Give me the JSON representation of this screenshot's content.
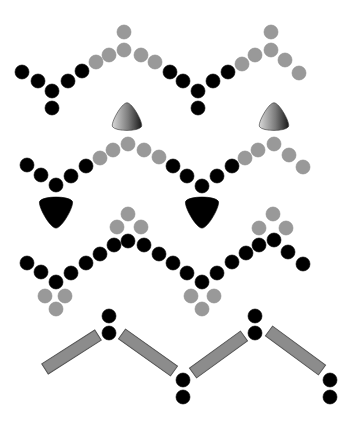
{
  "colors": {
    "black": "#000000",
    "grey": "#999999",
    "grey_stroke": "#8a8a8a",
    "bar_fill": "#8c8c8c",
    "bar_stroke": "#555555",
    "background": "#ffffff"
  },
  "dot_radius": 7,
  "rows": [
    {
      "name": "row-1-chain",
      "dots": [
        {
          "x": 22,
          "y": 72,
          "c": "black"
        },
        {
          "x": 38,
          "y": 81,
          "c": "black"
        },
        {
          "x": 52,
          "y": 91,
          "c": "black"
        },
        {
          "x": 52,
          "y": 108,
          "c": "black"
        },
        {
          "x": 68,
          "y": 81,
          "c": "black"
        },
        {
          "x": 82,
          "y": 71,
          "c": "black"
        },
        {
          "x": 96,
          "y": 62,
          "c": "grey"
        },
        {
          "x": 109,
          "y": 55,
          "c": "grey"
        },
        {
          "x": 124,
          "y": 50,
          "c": "grey"
        },
        {
          "x": 124,
          "y": 32,
          "c": "grey"
        },
        {
          "x": 141,
          "y": 55,
          "c": "grey"
        },
        {
          "x": 155,
          "y": 62,
          "c": "grey"
        },
        {
          "x": 170,
          "y": 72,
          "c": "black"
        },
        {
          "x": 183,
          "y": 81,
          "c": "black"
        },
        {
          "x": 198,
          "y": 91,
          "c": "black"
        },
        {
          "x": 198,
          "y": 108,
          "c": "black"
        },
        {
          "x": 213,
          "y": 81,
          "c": "black"
        },
        {
          "x": 228,
          "y": 72,
          "c": "black"
        },
        {
          "x": 242,
          "y": 64,
          "c": "grey"
        },
        {
          "x": 255,
          "y": 55,
          "c": "grey"
        },
        {
          "x": 271,
          "y": 50,
          "c": "grey"
        },
        {
          "x": 271,
          "y": 32,
          "c": "grey"
        },
        {
          "x": 285,
          "y": 60,
          "c": "grey"
        },
        {
          "x": 299,
          "y": 73,
          "c": "grey"
        }
      ]
    },
    {
      "name": "row-2-chain",
      "dots": [
        {
          "x": 27,
          "y": 165,
          "c": "black"
        },
        {
          "x": 41,
          "y": 175,
          "c": "black"
        },
        {
          "x": 56,
          "y": 185,
          "c": "black"
        },
        {
          "x": 71,
          "y": 176,
          "c": "black"
        },
        {
          "x": 86,
          "y": 166,
          "c": "black"
        },
        {
          "x": 100,
          "y": 158,
          "c": "grey"
        },
        {
          "x": 113,
          "y": 150,
          "c": "grey"
        },
        {
          "x": 128,
          "y": 144,
          "c": "grey"
        },
        {
          "x": 144,
          "y": 150,
          "c": "grey"
        },
        {
          "x": 159,
          "y": 157,
          "c": "grey"
        },
        {
          "x": 173,
          "y": 166,
          "c": "black"
        },
        {
          "x": 187,
          "y": 176,
          "c": "black"
        },
        {
          "x": 202,
          "y": 186,
          "c": "black"
        },
        {
          "x": 217,
          "y": 176,
          "c": "black"
        },
        {
          "x": 232,
          "y": 166,
          "c": "black"
        },
        {
          "x": 245,
          "y": 158,
          "c": "grey"
        },
        {
          "x": 258,
          "y": 150,
          "c": "grey"
        },
        {
          "x": 274,
          "y": 144,
          "c": "grey"
        },
        {
          "x": 289,
          "y": 155,
          "c": "grey"
        },
        {
          "x": 303,
          "y": 167,
          "c": "grey"
        }
      ],
      "blobs": [
        {
          "x": 127,
          "y": 118,
          "size": 16,
          "kind": "grey-gradient",
          "dir": "up"
        },
        {
          "x": 274,
          "y": 118,
          "size": 16,
          "kind": "grey-gradient",
          "dir": "up"
        },
        {
          "x": 56,
          "y": 211,
          "size": 18,
          "kind": "black",
          "dir": "down"
        },
        {
          "x": 202,
          "y": 211,
          "size": 18,
          "kind": "black",
          "dir": "down"
        }
      ]
    },
    {
      "name": "row-3-chain",
      "dots": [
        {
          "x": 128,
          "y": 214,
          "c": "grey"
        },
        {
          "x": 117,
          "y": 227,
          "c": "grey"
        },
        {
          "x": 141,
          "y": 227,
          "c": "grey"
        },
        {
          "x": 273,
          "y": 214,
          "c": "grey"
        },
        {
          "x": 259,
          "y": 228,
          "c": "grey"
        },
        {
          "x": 286,
          "y": 228,
          "c": "grey"
        },
        {
          "x": 27,
          "y": 263,
          "c": "black"
        },
        {
          "x": 41,
          "y": 272,
          "c": "black"
        },
        {
          "x": 56,
          "y": 282,
          "c": "black"
        },
        {
          "x": 71,
          "y": 273,
          "c": "black"
        },
        {
          "x": 86,
          "y": 263,
          "c": "black"
        },
        {
          "x": 100,
          "y": 254,
          "c": "black"
        },
        {
          "x": 114,
          "y": 245,
          "c": "black"
        },
        {
          "x": 128,
          "y": 241,
          "c": "black"
        },
        {
          "x": 144,
          "y": 245,
          "c": "black"
        },
        {
          "x": 159,
          "y": 254,
          "c": "black"
        },
        {
          "x": 173,
          "y": 263,
          "c": "black"
        },
        {
          "x": 187,
          "y": 273,
          "c": "black"
        },
        {
          "x": 202,
          "y": 282,
          "c": "black"
        },
        {
          "x": 217,
          "y": 273,
          "c": "black"
        },
        {
          "x": 232,
          "y": 262,
          "c": "black"
        },
        {
          "x": 246,
          "y": 253,
          "c": "black"
        },
        {
          "x": 259,
          "y": 245,
          "c": "black"
        },
        {
          "x": 274,
          "y": 240,
          "c": "black"
        },
        {
          "x": 288,
          "y": 252,
          "c": "black"
        },
        {
          "x": 303,
          "y": 264,
          "c": "black"
        },
        {
          "x": 45,
          "y": 296,
          "c": "grey"
        },
        {
          "x": 65,
          "y": 296,
          "c": "grey"
        },
        {
          "x": 56,
          "y": 309,
          "c": "grey"
        },
        {
          "x": 191,
          "y": 296,
          "c": "grey"
        },
        {
          "x": 214,
          "y": 296,
          "c": "grey"
        },
        {
          "x": 202,
          "y": 309,
          "c": "grey"
        }
      ]
    },
    {
      "name": "row-4-chain",
      "dots": [
        {
          "x": 109,
          "y": 316,
          "c": "black"
        },
        {
          "x": 109,
          "y": 333,
          "c": "black"
        },
        {
          "x": 183,
          "y": 380,
          "c": "black"
        },
        {
          "x": 183,
          "y": 397,
          "c": "black"
        },
        {
          "x": 255,
          "y": 316,
          "c": "black"
        },
        {
          "x": 255,
          "y": 333,
          "c": "black"
        },
        {
          "x": 330,
          "y": 380,
          "c": "black"
        },
        {
          "x": 330,
          "y": 397,
          "c": "black"
        }
      ],
      "bars": [
        {
          "x1": 45,
          "y1": 369,
          "x2": 98,
          "y2": 335
        },
        {
          "x1": 122,
          "y1": 334,
          "x2": 174,
          "y2": 371
        },
        {
          "x1": 193,
          "y1": 373,
          "x2": 244,
          "y2": 336
        },
        {
          "x1": 269,
          "y1": 331,
          "x2": 322,
          "y2": 370
        }
      ]
    }
  ]
}
